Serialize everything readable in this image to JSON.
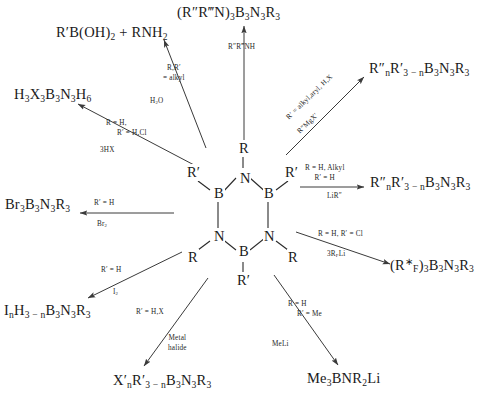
{
  "diagram": {
    "center": {
      "name": "borazine-ring",
      "ring_atoms": [
        "N",
        "B",
        "N",
        "B",
        "N",
        "B"
      ],
      "n_substituent": "R",
      "b_substituent": "R′",
      "labels": {
        "n_top": "N",
        "b_right": "B",
        "b_left": "B",
        "n_left": "N",
        "n_right": "N",
        "b_bottom": "B",
        "r_top": "R",
        "rp_left": "R′",
        "rp_right": "R′",
        "r_lowerleft": "R",
        "r_lowerright": "R",
        "rp_bottom": "R′"
      }
    },
    "reactions": [
      {
        "id": "hydrolysis",
        "direction": "upper-left",
        "product_html": "R′B(OH)<sub>2</sub>  +  RNH<sub>2</sub>",
        "conditions": [
          "R,R′",
          "= alkyl"
        ],
        "reagent": "H<sub>2</sub>O"
      },
      {
        "id": "amination",
        "direction": "up",
        "product_html": "(R″R‴N)<sub>3</sub>B<sub>3</sub>N<sub>3</sub>R<sub>3</sub>",
        "conditions": [],
        "reagent": "R″R‴NH"
      },
      {
        "id": "grignard",
        "direction": "upper-right",
        "product_html": "R″<sub>n</sub>R′<sub>3 − n</sub>B<sub>3</sub>N<sub>3</sub>R<sub>3</sub>",
        "conditions": [
          "R′ = alkyl,aryl, H,X"
        ],
        "reagent": "R″MgX′"
      },
      {
        "id": "organolithium",
        "direction": "right",
        "product_html": "R″<sub>n</sub>R′<sub>3 − n</sub>B<sub>3</sub>N<sub>3</sub>R<sub>3</sub>",
        "conditions": [
          "R = H, Alkyl",
          "R′ = H"
        ],
        "reagent": "LiR″"
      },
      {
        "id": "fluoroalkyl",
        "direction": "lower-right",
        "product_html": "(R<sup>∗</sup><sub>F</sub>)<sub>3</sub>B<sub>3</sub>N<sub>3</sub>R<sub>3</sub>",
        "conditions": [
          "R = H, R′ = Cl"
        ],
        "reagent": "3R<sub>F</sub>Li"
      },
      {
        "id": "methyllithium",
        "direction": "bottom-right",
        "product_html": "Me<sub>3</sub>BNR<sub>2</sub>Li",
        "conditions": [
          "R = H",
          "R′ = Me"
        ],
        "reagent": "MeLi"
      },
      {
        "id": "metal-halide",
        "direction": "bottom-left",
        "product_html": "X′<sub>n</sub>R′<sub>3 − n</sub>B<sub>3</sub>N<sub>3</sub>R<sub>3</sub>",
        "conditions": [
          "R′ = H,X"
        ],
        "reagent": "Metal halide"
      },
      {
        "id": "iodination",
        "direction": "lower-left",
        "product_html": "I<sub>n</sub>H<sub>3 − n</sub>B<sub>3</sub>N<sub>3</sub>R<sub>3</sub>",
        "conditions": [
          "R′ = H"
        ],
        "reagent": "I<sub>2</sub>"
      },
      {
        "id": "bromination",
        "direction": "left",
        "product_html": "Br<sub>3</sub>B<sub>3</sub>N<sub>3</sub>R<sub>3</sub>",
        "conditions": [
          "R′ = H"
        ],
        "reagent": "Br<sub>2</sub>"
      },
      {
        "id": "protonolysis",
        "direction": "upper-left-2",
        "product_html": "H<sub>3</sub>X<sub>3</sub>B<sub>3</sub>N<sub>3</sub>H<sub>6</sub>",
        "conditions": [
          "R = H,",
          "R′ = H,Cl"
        ],
        "reagent": "3HX"
      }
    ]
  }
}
